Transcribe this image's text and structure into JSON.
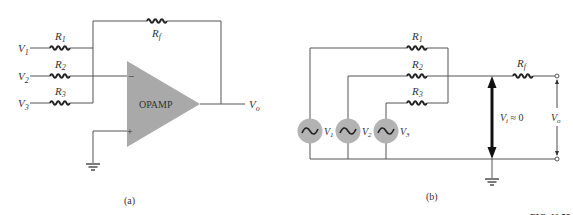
{
  "diagram_a": {
    "caption": "(a)",
    "inputs": [
      {
        "voltage": "V",
        "voltage_sub": "1",
        "resistor": "R",
        "resistor_sub": "1"
      },
      {
        "voltage": "V",
        "voltage_sub": "2",
        "resistor": "R",
        "resistor_sub": "2"
      },
      {
        "voltage": "V",
        "voltage_sub": "3",
        "resistor": "R",
        "resistor_sub": "3"
      }
    ],
    "feedback_resistor": {
      "label": "R",
      "sub": "f"
    },
    "opamp_label": "OPAMP",
    "inverting_symbol": "−",
    "noninverting_symbol": "+",
    "output": {
      "label": "V",
      "sub": "o"
    }
  },
  "diagram_b": {
    "caption": "(b)",
    "resistors": [
      {
        "label": "R",
        "sub": "1"
      },
      {
        "label": "R",
        "sub": "2"
      },
      {
        "label": "R",
        "sub": "3"
      }
    ],
    "sources": [
      {
        "label": "V",
        "sub": "1"
      },
      {
        "label": "V",
        "sub": "2"
      },
      {
        "label": "V",
        "sub": "3"
      }
    ],
    "feedback_resistor": {
      "label": "R",
      "sub": "f"
    },
    "virtual_ground": {
      "label": "V",
      "sub": "i",
      "relation": " ≈ 0"
    },
    "output": {
      "label": "V",
      "sub": "o"
    }
  },
  "figure_label": "FIG. 11.58",
  "colors": {
    "wire": "#555555",
    "opamp_fill": "#a9a9a9",
    "source_fill": "#b3b3b3",
    "arrow": "#111111"
  }
}
